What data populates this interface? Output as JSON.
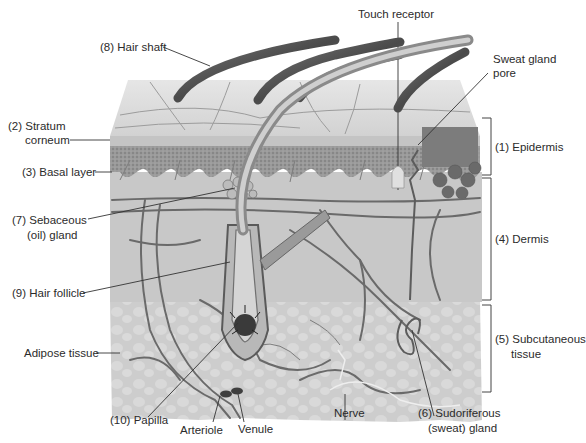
{
  "diagram": {
    "type": "anatomical-cross-section",
    "colors": {
      "background": "#ffffff",
      "epidermis_top": "#d8d8d8",
      "epidermis_granular": "#8e8e8e",
      "dermis": "#c9c9c9",
      "subcutaneous": "#cfcfcf",
      "hair": "#5c5c5c",
      "vessel": "#6b6b6b",
      "leader_line": "#333333"
    }
  },
  "labels": {
    "hair_shaft": "(8) Hair shaft",
    "touch_receptor": "Touch receptor",
    "sweat_pore_line1": "Sweat gland",
    "sweat_pore_line2": "pore",
    "stratum_line1": "(2) Stratum",
    "stratum_line2": "corneum",
    "basal_layer": "(3) Basal layer",
    "sebaceous_line1": "(7) Sebaceous",
    "sebaceous_line2": "(oil) gland",
    "hair_follicle": "(9) Hair follicle",
    "adipose_tissue": "Adipose tissue",
    "papilla": "(10) Papilla",
    "arteriole": "Arteriole",
    "venule": "Venule",
    "nerve": "Nerve",
    "sudoriferous_line1": "(6) Sudoriferous",
    "sudoriferous_line2": "(sweat) gland",
    "epidermis": "(1) Epidermis",
    "dermis": "(4) Dermis",
    "subcutaneous_line1": "(5) Subcutaneous",
    "subcutaneous_line2": "tissue"
  }
}
